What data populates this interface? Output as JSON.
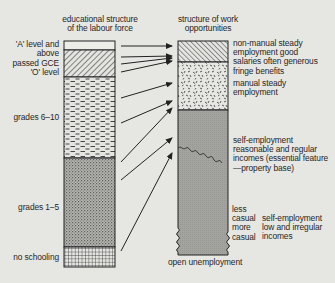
{
  "diagram": {
    "left_column": {
      "title_line1": "educational structure",
      "title_line2": "of the labour force",
      "levels": [
        {
          "id": "a_level",
          "line1": "'A' level and",
          "line2": "above",
          "pattern": "blank"
        },
        {
          "id": "o_level",
          "line1": "passed GCE",
          "line2": "'O' level",
          "pattern": "diagonal-hatch"
        },
        {
          "id": "grades_6_10",
          "line1": "grades 6–10",
          "pattern": "brick-dashes"
        },
        {
          "id": "grades_1_5",
          "line1": "grades 1–5",
          "pattern": "fine-stipple"
        },
        {
          "id": "no_schooling",
          "line1": "no schooling",
          "pattern": "grid"
        }
      ]
    },
    "right_column": {
      "title_line1": "structure of work",
      "title_line2": "opportunities",
      "categories": [
        {
          "id": "non_manual",
          "lines": [
            "non-manual steady",
            "employment good",
            "salaries often generous",
            "fringe benefits"
          ],
          "pattern": "diagonal-hatch"
        },
        {
          "id": "manual",
          "lines": [
            "manual steady",
            "employment"
          ],
          "pattern": "confetti"
        },
        {
          "id": "self_employment_regular",
          "lines": [
            "self-employment",
            "reasonable and regular",
            "incomes (essential feature",
            "—property base)"
          ],
          "pattern": "grey-stipple"
        },
        {
          "id": "self_employment_irregular",
          "lines": [
            "self-employment",
            "low and irregular",
            "incomes"
          ],
          "pattern": "grey-stipple"
        }
      ],
      "casual_scale": {
        "less": "less",
        "casual1": "casual",
        "more": "more",
        "casual2": "casual"
      },
      "bottom_label": "open unemployment"
    },
    "arrows": [
      {
        "from": "a_level",
        "to": "non_manual"
      },
      {
        "from": "o_level",
        "to": "non_manual"
      },
      {
        "from": "o_level",
        "to": "non_manual"
      },
      {
        "from": "o_level",
        "to": "non_manual"
      },
      {
        "from": "grades_6_10",
        "to": "manual"
      },
      {
        "from": "grades_6_10",
        "to": "self_employment_regular"
      },
      {
        "from": "grades_6_10",
        "to": "self_employment_regular"
      },
      {
        "from": "grades_1_5",
        "to": "self_employment_regular"
      },
      {
        "from": "no_schooling",
        "to": "self_employment_irregular"
      }
    ],
    "colors": {
      "background": "#e6e6e3",
      "ink": "#2a2a2a",
      "grey_fill": "#9a9a96"
    }
  }
}
